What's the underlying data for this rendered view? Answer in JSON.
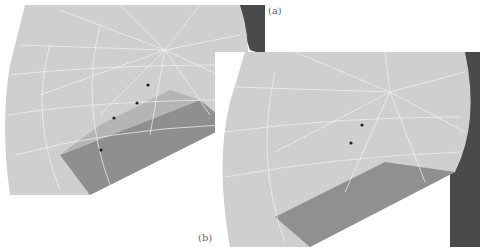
{
  "figure": {
    "panels": [
      {
        "label": "(a)",
        "description": "3D mesh render, view a"
      },
      {
        "label": "(b)",
        "description": "3D mesh render, view b"
      }
    ],
    "colors": {
      "mesh_light": "#d8d8d8",
      "mesh_mid": "#a8a8a8",
      "mesh_dark": "#7a7a7a",
      "edge": "#f2f2f2",
      "bg_dark": "#4a4a4a",
      "marker": "#222222"
    }
  }
}
